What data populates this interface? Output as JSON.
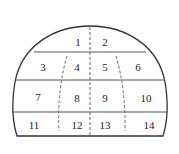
{
  "diagram": {
    "title": "",
    "outline_color": "#333333",
    "divider_color": "#555555",
    "dashed_color": "#555555",
    "zones": [
      {
        "id": "1",
        "label": "1"
      },
      {
        "id": "2",
        "label": "2"
      },
      {
        "id": "3",
        "label": "3"
      },
      {
        "id": "4",
        "label": "4"
      },
      {
        "id": "5",
        "label": "5"
      },
      {
        "id": "6",
        "label": "6"
      },
      {
        "id": "7",
        "label": "7"
      },
      {
        "id": "8",
        "label": "8"
      },
      {
        "id": "9",
        "label": "9"
      },
      {
        "id": "10",
        "label": "10"
      },
      {
        "id": "11",
        "label": "11"
      },
      {
        "id": "12",
        "label": "12"
      },
      {
        "id": "13",
        "label": "13"
      },
      {
        "id": "14",
        "label": "14"
      }
    ]
  }
}
